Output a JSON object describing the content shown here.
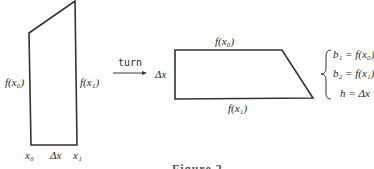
{
  "figure": {
    "left_shape": {
      "left_side_label": "f(x₀)",
      "right_side_label": "f(x₁)",
      "bottom_labels": [
        "x₀",
        "Δx",
        "x₁"
      ]
    },
    "arrow": {
      "label": "turn"
    },
    "right_shape": {
      "top_label": "f(x₀)",
      "bottom_label": "f(x₁)",
      "left_label": "Δx"
    },
    "equations": [
      "b₁ = f(x₀)",
      "b₂ = f(x₁)",
      "h = Δx"
    ],
    "caption": "Figure 2"
  }
}
